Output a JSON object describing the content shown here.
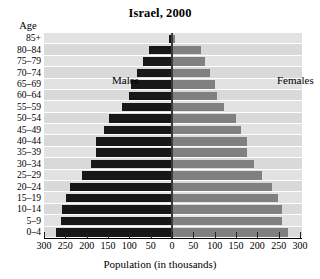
{
  "chart_data": {
    "type": "bar",
    "subtype": "population-pyramid",
    "title": "Israel, 2000",
    "xlabel": "Population (in thousands)",
    "ylabel": "Age",
    "grid": true,
    "legend_position": "inside-plot",
    "xlim": [
      -300,
      300
    ],
    "xticks": [
      300,
      250,
      200,
      150,
      100,
      50,
      0,
      50,
      100,
      150,
      200,
      250,
      300
    ],
    "categories": [
      "0–4",
      "5–9",
      "10–14",
      "15–19",
      "20–24",
      "25–29",
      "30–34",
      "35–39",
      "40–44",
      "45–49",
      "50–54",
      "55–59",
      "60–64",
      "65–69",
      "70–74",
      "75–79",
      "80–84",
      "85+"
    ],
    "series": [
      {
        "name": "Males",
        "color": "#171717",
        "values": [
          272,
          260,
          258,
          248,
          238,
          212,
          190,
          178,
          178,
          160,
          148,
          118,
          100,
          95,
          82,
          68,
          55,
          6
        ]
      },
      {
        "name": "Females",
        "color": "#808080",
        "values": [
          272,
          258,
          258,
          248,
          235,
          210,
          192,
          175,
          175,
          162,
          150,
          122,
          105,
          100,
          90,
          78,
          68,
          8
        ]
      }
    ]
  },
  "labels": {
    "age_caption": "Age",
    "males": "Males",
    "females": "Females"
  }
}
